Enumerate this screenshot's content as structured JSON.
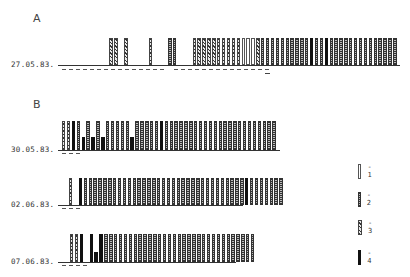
{
  "chart_data": {
    "type": "bar",
    "title": "",
    "legend": [
      {
        "code": 1,
        "label": "- 1",
        "style": "open/white"
      },
      {
        "code": 2,
        "label": "- 2",
        "style": "dotted/checkered"
      },
      {
        "code": 3,
        "label": "- 3",
        "style": "diagonal hatched"
      },
      {
        "code": 4,
        "label": "- 4",
        "style": "solid black"
      }
    ],
    "panels": [
      {
        "letter": "A",
        "rows": [
          {
            "date": "27.05.83.",
            "bars": [
              0,
              0,
              0,
              0,
              0,
              3,
              3,
              0,
              3,
              0,
              0,
              0,
              0,
              3,
              0,
              0,
              0,
              2,
              2,
              0,
              0,
              0,
              3,
              3,
              3,
              3,
              3,
              3,
              3,
              3,
              3,
              3,
              1,
              1,
              1,
              3,
              2,
              2,
              2,
              2,
              2,
              2,
              2,
              2,
              2,
              2,
              4,
              2,
              2,
              4,
              2,
              2,
              2,
              2,
              2,
              2,
              2,
              2,
              2,
              2,
              2,
              2,
              2,
              2
            ],
            "heights": "full",
            "dashes": [
              1,
              1,
              1,
              1,
              1,
              1,
              1,
              1,
              1,
              1,
              1,
              1,
              1,
              1,
              1,
              0,
              1,
              1,
              1,
              1,
              1,
              1,
              1,
              1,
              1,
              1,
              1,
              1,
              1,
              1
            ]
          }
        ]
      },
      {
        "letter": "B",
        "rows": [
          {
            "date": "30.05.83.",
            "bars": [
              3,
              3,
              4,
              2,
              4,
              2,
              4,
              2,
              4,
              2,
              2,
              2,
              2,
              2,
              4,
              2,
              2,
              2,
              2,
              2,
              4,
              2,
              2,
              2,
              2,
              2,
              2,
              2,
              2,
              2,
              2,
              2,
              2,
              2,
              2,
              2,
              2,
              2,
              2,
              2,
              2,
              2,
              2,
              2
            ],
            "heights": [
              1,
              1,
              1,
              1,
              0.45,
              1,
              0.45,
              1,
              0.45,
              1,
              1,
              1,
              1,
              1,
              0.45,
              1,
              1,
              1,
              1,
              1,
              1,
              1,
              1,
              1,
              1,
              1,
              1,
              1,
              1,
              1,
              1,
              1,
              1,
              1,
              1,
              1,
              1,
              1,
              1,
              1,
              1,
              1,
              1,
              1
            ],
            "dashes": [
              1,
              1,
              1
            ]
          },
          {
            "date": "02.06.83.",
            "bars": [
              3,
              0,
              4,
              2,
              2,
              2,
              2,
              2,
              2,
              2,
              2,
              2,
              2,
              2,
              2,
              2,
              2,
              2,
              2,
              2,
              2,
              2,
              2,
              2,
              2,
              2,
              2,
              2,
              2,
              2,
              2,
              2,
              2,
              2,
              2,
              2,
              4,
              2,
              2,
              2,
              2,
              2,
              2,
              2
            ],
            "heights": "full",
            "dashes": [
              1,
              1,
              1
            ]
          },
          {
            "date": "07.06.83.",
            "bars": [
              3,
              3,
              4,
              0,
              4,
              4,
              4,
              2,
              2,
              2,
              2,
              2,
              2,
              2,
              2,
              2,
              2,
              2,
              2,
              2,
              2,
              2,
              2,
              2,
              2,
              2,
              2,
              2,
              2,
              2,
              2,
              2,
              2,
              2,
              2,
              2,
              2,
              2
            ],
            "heights": [
              1,
              1,
              1,
              0,
              1,
              0.35,
              1,
              1,
              1,
              1,
              1,
              1,
              1,
              1,
              1,
              1,
              1,
              1,
              1,
              1,
              1,
              1,
              1,
              1,
              1,
              1,
              1,
              1,
              1,
              1,
              1,
              1,
              1,
              1,
              1,
              1,
              1,
              1
            ],
            "dashes": [
              1,
              1,
              1,
              1
            ]
          }
        ]
      }
    ],
    "xlabel": "",
    "ylabel": ""
  },
  "labels": {
    "panel_a": "A",
    "panel_b": "B",
    "row_a1": "27.05.83.",
    "row_b1": "30.05.83.",
    "row_b2": "02.06.83.",
    "row_b3": "07.06.83.",
    "legend_1": "- 1",
    "legend_2": "- 2",
    "legend_3": "- 3",
    "legend_4": "- 4"
  }
}
